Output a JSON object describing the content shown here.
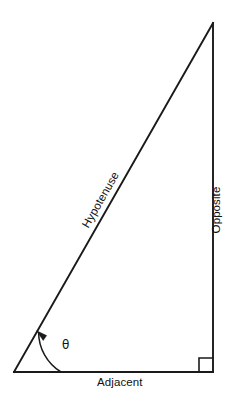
{
  "diagram": {
    "background_color": "#ffffff",
    "stroke_color": "#1a1a1a",
    "labels": {
      "hypotenuse": "Hypotenuse",
      "opposite": "Opposite",
      "adjacent": "Adjacent",
      "angle": "θ"
    },
    "geometry": {
      "vertex_angle": {
        "x": 14,
        "y": 372
      },
      "vertex_right_angle": {
        "x": 213,
        "y": 372
      },
      "vertex_apex": {
        "x": 213,
        "y": 23
      },
      "adjacent_length_px": 199,
      "opposite_length_px": 349,
      "angle_degrees": 60.3,
      "arc_radius_px": 47,
      "right_angle_marker_size_px": 14
    },
    "elements": {
      "hypotenuse_line": "line from angle vertex to apex",
      "opposite_line": "vertical line from apex to right-angle vertex",
      "adjacent_line": "horizontal line from angle vertex to right-angle vertex",
      "angle_arc": "arc with arrowhead marking angle theta",
      "right_angle_square": "square marker indicating 90 degrees"
    }
  }
}
